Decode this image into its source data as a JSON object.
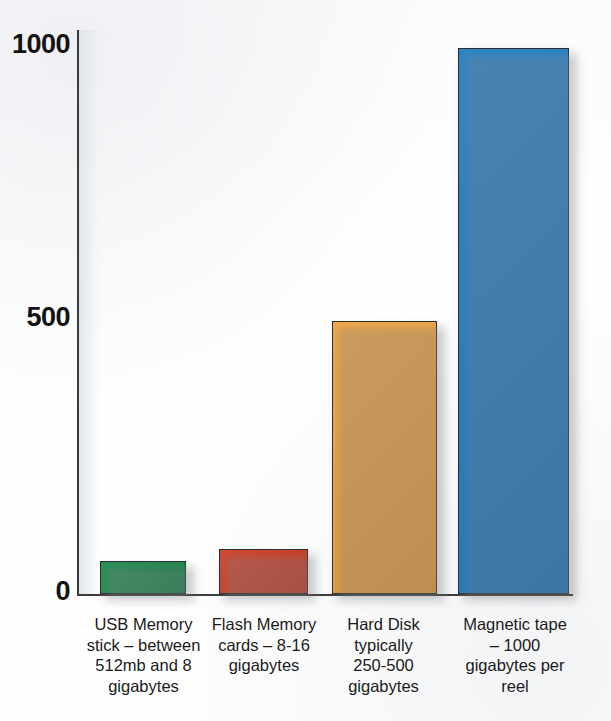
{
  "chart_data": {
    "type": "bar",
    "title": "",
    "subtitle": "",
    "xlabel": "",
    "ylabel": "",
    "ylim": [
      0,
      1000
    ],
    "yticks": [
      "0",
      "500",
      "1000"
    ],
    "grid": false,
    "legend": "none",
    "categories": [
      "USB Memory\nstick – between\n512mb and 8\ngigabytes",
      "Flash Memory\ncards – 8-16\ngigabytes",
      "Hard Disk\ntypically\n250-500\ngigabytes",
      "Magnetic tape\n– 1000\ngigabytes per\nreel"
    ],
    "values": [
      60,
      82,
      500,
      1000
    ],
    "colors": [
      "#1a8a4a",
      "#d43a22",
      "#f5a63c",
      "#1b7ec8"
    ],
    "series": [
      {
        "name": "Storage capacity (gigabytes)",
        "values": [
          60,
          82,
          500,
          1000
        ]
      }
    ]
  },
  "axis": {
    "y": {
      "tick_1000": "1000",
      "tick_500": "500",
      "tick_0": "0"
    }
  },
  "bars": [
    {
      "id": "usb-memory-stick",
      "label": "USB Memory\nstick – between\n512mb and 8\ngigabytes",
      "value": 60,
      "color": "#1a8a4a"
    },
    {
      "id": "flash-memory-cards",
      "label": "Flash Memory\ncards – 8-16\ngigabytes",
      "value": 82,
      "color": "#d43a22"
    },
    {
      "id": "hard-disk",
      "label": "Hard Disk\ntypically\n250-500\ngigabytes",
      "value": 500,
      "color": "#f5a63c"
    },
    {
      "id": "magnetic-tape",
      "label": "Magnetic tape\n– 1000\ngigabytes per\nreel",
      "value": 1000,
      "color": "#1b7ec8"
    }
  ]
}
